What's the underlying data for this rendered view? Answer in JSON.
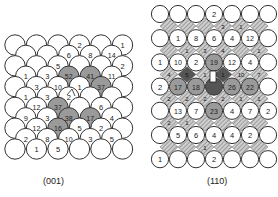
{
  "figure": {
    "panels": [
      {
        "id": "001",
        "label": "(001)",
        "lattice": "square (viewed along diagonal)",
        "rows": [
          {
            "type": "wide",
            "values": [
              "",
              "",
              "",
              "2",
              "",
              "1"
            ]
          },
          {
            "type": "narrow",
            "values": [
              "",
              "",
              "6",
              "8",
              "14"
            ]
          },
          {
            "type": "wide",
            "values": [
              "",
              "",
              "5",
              "",
              "",
              "2"
            ]
          },
          {
            "type": "narrow",
            "values": [
              "1",
              "3",
              "52",
              "41",
              "11"
            ],
            "shaded": [
              2,
              3
            ]
          },
          {
            "type": "wide",
            "values": [
              "",
              "3",
              "10",
              "1",
              "37",
              ""
            ],
            "shaded": [
              4
            ]
          },
          {
            "type": "narrow",
            "values": [
              "1",
              "3",
              "2",
              "",
              ""
            ]
          },
          {
            "type": "wide",
            "values": [
              "",
              "12",
              "37",
              "",
              "6",
              ""
            ],
            "shaded": [
              2
            ]
          },
          {
            "type": "narrow",
            "values": [
              "9",
              "3",
              "38",
              "17",
              "4"
            ],
            "shaded": [
              2,
              3
            ]
          },
          {
            "type": "wide",
            "values": [
              "",
              "12",
              "16",
              "5",
              "2",
              ""
            ],
            "shaded": [
              2
            ]
          },
          {
            "type": "narrow",
            "values": [
              "2",
              "8",
              "10",
              "3",
              "5"
            ]
          },
          {
            "type": "wide",
            "values": [
              "",
              "1",
              "5",
              "",
              "",
              ""
            ]
          }
        ]
      },
      {
        "id": "110",
        "label": "(110)",
        "lattice": "rectangular with hatched second-layer sites",
        "rows": [
          {
            "values": [
              "",
              "",
              "",
              "2",
              "",
              "",
              ""
            ]
          },
          {
            "values": [
              "",
              "1",
              "8",
              "6",
              "4",
              "12",
              ""
            ]
          },
          {
            "values": [
              "1",
              "10",
              "2",
              "19",
              "12",
              "4",
              ""
            ],
            "shaded": [
              3
            ]
          },
          {
            "values": [
              "2",
              "17",
              "18",
              "",
              "26",
              "22",
              ""
            ],
            "shaded": [
              1,
              2,
              4,
              5
            ]
          },
          {
            "values": [
              "",
              "13",
              "7",
              "23",
              "4",
              "7",
              "2"
            ],
            "shaded": [
              3
            ]
          },
          {
            "values": [
              "",
              "5",
              "6",
              "4",
              "4",
              "2",
              ""
            ]
          },
          {
            "values": [
              "1",
              "",
              "",
              "2",
              "",
              "",
              ""
            ]
          }
        ],
        "diamond_rows": [
          [
            "",
            "",
            "",
            "3",
            "1",
            ""
          ],
          [
            "",
            "1",
            "3",
            "4",
            "",
            "1"
          ],
          [
            "4",
            "5",
            "1",
            "1",
            "10",
            "7"
          ],
          [
            "2",
            "2",
            "2",
            "2",
            "1",
            "1"
          ],
          [
            "2",
            "1",
            "",
            "",
            "",
            ""
          ],
          [
            "",
            "",
            "1",
            "",
            "",
            ""
          ]
        ]
      }
    ],
    "colors": {
      "circle_fill": "#ffffff",
      "circle_stroke": "#333333",
      "shaded_fill": "#9a9a9a",
      "dark_fill": "#555555",
      "hatch": "#8a8a8a"
    }
  }
}
